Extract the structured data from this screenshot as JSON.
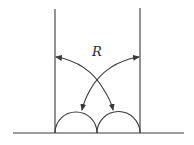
{
  "diagram": {
    "label": "R",
    "colors": {
      "stroke": "#3a3a3a",
      "text": "#2a2a2a",
      "background": "#ffffff"
    },
    "elements": {
      "baseline": {
        "x1": 13,
        "y1": 133,
        "x2": 184,
        "y2": 133
      },
      "left_wall": {
        "x": 55,
        "y_top": 9,
        "y_bottom": 133
      },
      "right_wall": {
        "x": 140,
        "y_top": 8,
        "y_bottom": 133
      },
      "left_semicircle": {
        "cx": 76,
        "cy": 133,
        "r": 21
      },
      "right_semicircle": {
        "cx": 118.5,
        "cy": 133,
        "r": 21.5
      },
      "arc_left_to_right": {
        "start": [
          56,
          57
        ],
        "end": [
          113,
          110
        ]
      },
      "arc_right_to_left": {
        "start": [
          139,
          57
        ],
        "end": [
          82,
          110
        ]
      },
      "crossing_point": [
        97,
        82
      ],
      "label_position": [
        97,
        55
      ]
    }
  }
}
